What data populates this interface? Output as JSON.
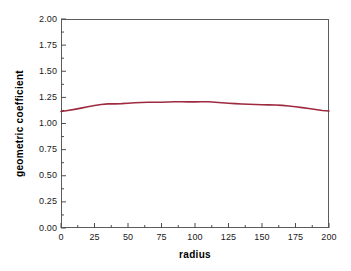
{
  "chart_data": {
    "type": "line",
    "title": "",
    "subtitle": "",
    "xlabel": "radius",
    "ylabel": "geometric coefficient",
    "xlim": [
      0,
      200
    ],
    "ylim": [
      0.0,
      2.0
    ],
    "grid": false,
    "legend": null,
    "legend_position": "none",
    "x_major_ticks": [
      0,
      25,
      50,
      75,
      100,
      125,
      150,
      175,
      200
    ],
    "x_tick_labels": [
      "0",
      "25",
      "50",
      "75",
      "100",
      "125",
      "150",
      "175",
      "200"
    ],
    "x_minor_tick_interval": 12.5,
    "y_major_ticks": [
      0.0,
      0.25,
      0.5,
      0.75,
      1.0,
      1.25,
      1.5,
      1.75,
      2.0
    ],
    "y_tick_labels": [
      "0.00",
      "0.25",
      "0.50",
      "0.75",
      "1.00",
      "1.25",
      "1.50",
      "1.75",
      "2.00"
    ],
    "y_minor_tick_interval": 0.125,
    "series": [
      {
        "name": "geometric coefficient",
        "color": "#9e2a3f",
        "line_width": 1.6,
        "x": [
          0,
          5,
          10,
          15,
          20,
          25,
          30,
          35,
          40,
          45,
          50,
          55,
          60,
          65,
          70,
          75,
          80,
          85,
          90,
          95,
          100,
          105,
          110,
          115,
          120,
          125,
          130,
          135,
          140,
          145,
          150,
          155,
          160,
          165,
          170,
          175,
          180,
          185,
          190,
          195,
          200
        ],
        "y": [
          1.115,
          1.125,
          1.135,
          1.147,
          1.16,
          1.172,
          1.182,
          1.188,
          1.188,
          1.19,
          1.194,
          1.198,
          1.201,
          1.203,
          1.203,
          1.204,
          1.206,
          1.208,
          1.208,
          1.207,
          1.207,
          1.208,
          1.208,
          1.203,
          1.198,
          1.194,
          1.19,
          1.187,
          1.184,
          1.182,
          1.18,
          1.178,
          1.177,
          1.173,
          1.167,
          1.16,
          1.152,
          1.143,
          1.134,
          1.124,
          1.119
        ]
      }
    ],
    "frame_color": "#5c5c5c",
    "background_color": "#ffffff",
    "tick_color": "#4d4d4d",
    "text_color": "#1a1a1a"
  }
}
